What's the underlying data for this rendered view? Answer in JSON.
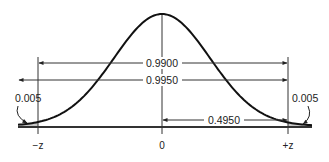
{
  "diagram": {
    "type": "normal-distribution",
    "title": "",
    "colors": {
      "curve": "#111111",
      "lines": "#333333",
      "tail_fill": "#c8c8c8",
      "baseline": "#333333"
    },
    "labels": {
      "central_area_099": "0.9900",
      "central_area_0995": "0.9950",
      "half_area": "0.4950",
      "left_tail": "0.005",
      "right_tail": "0.005"
    },
    "axis": {
      "left": "−z",
      "center": "0",
      "right": "+z"
    }
  }
}
